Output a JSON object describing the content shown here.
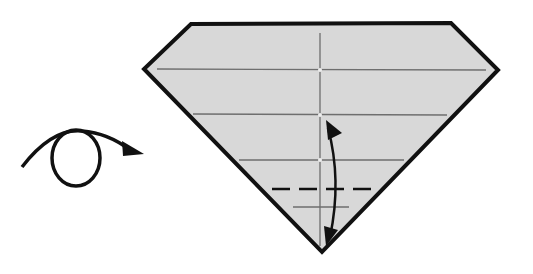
{
  "diagram": {
    "type": "origami-step",
    "colors": {
      "paper": "#d8d8d8",
      "outline": "#111111",
      "crease": "#777777",
      "background": "#ffffff"
    },
    "symbols": [
      {
        "name": "turn-over-arrow",
        "meaning": "turn the model over"
      },
      {
        "name": "fold-unfold-arrow",
        "meaning": "fold and unfold"
      },
      {
        "name": "valley-fold-line",
        "meaning": "dashed valley fold line"
      }
    ],
    "creases": {
      "horizontal_count": 4,
      "vertical_center": true
    }
  }
}
